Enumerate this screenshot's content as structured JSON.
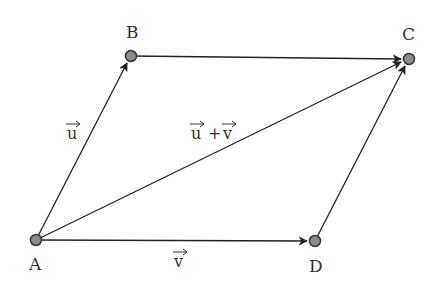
{
  "diagram": {
    "type": "parallelogram-vector-addition",
    "points": {
      "A": {
        "label": "A",
        "x": 36,
        "y": 240
      },
      "B": {
        "label": "B",
        "x": 131,
        "y": 56
      },
      "C": {
        "label": "C",
        "x": 409,
        "y": 59
      },
      "D": {
        "label": "D",
        "x": 315,
        "y": 241
      }
    },
    "vectors": {
      "u": {
        "label": "u",
        "from": "A",
        "to": "B"
      },
      "v": {
        "label": "v",
        "from": "A",
        "to": "D"
      },
      "sum": {
        "label_left": "u",
        "plus": "+",
        "label_right": "v",
        "from": "A",
        "to": "C"
      },
      "bc": {
        "from": "B",
        "to": "C"
      },
      "dc": {
        "from": "D",
        "to": "C"
      }
    },
    "colors": {
      "line": "#222222",
      "point_fill": "#8c8c8c",
      "point_stroke": "#333333",
      "text": "#333333"
    }
  }
}
